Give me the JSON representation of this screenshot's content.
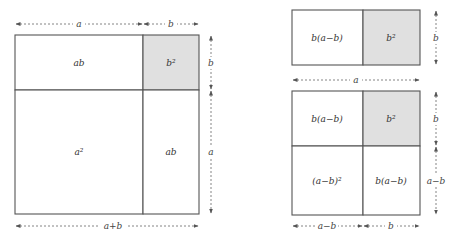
{
  "colors": {
    "shade": "#e0e0e0",
    "stroke": "#555555",
    "text": "#333333"
  },
  "left_figure": {
    "cells": {
      "top_left": "ab",
      "top_right": "b²",
      "bottom_left": "a²",
      "bottom_right": "ab"
    },
    "dimensions": {
      "top_a": "a",
      "top_b": "b",
      "right_b": "b",
      "right_a": "a",
      "bottom_total": "a+b"
    }
  },
  "right_top_figure": {
    "cells": {
      "left": "b(a−b)",
      "right": "b²"
    },
    "dimensions": {
      "right_b": "b",
      "bottom_a": "a"
    }
  },
  "right_bottom_figure": {
    "cells": {
      "top_left": "b(a−b)",
      "top_right": "b²",
      "bottom_left": "(a−b)²",
      "bottom_right": "b(a−b)"
    },
    "dimensions": {
      "right_b": "b",
      "right_a_minus_b": "a−b",
      "bottom_a_minus_b": "a−b",
      "bottom_b": "b"
    }
  }
}
